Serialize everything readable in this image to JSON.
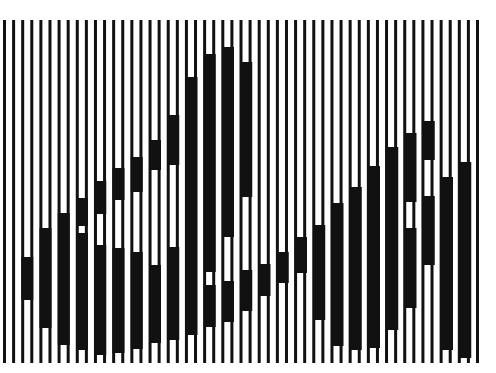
{
  "image": {
    "description": "Black and white optical illusion: vertical line grating with a hidden shape formed by thickened stripe segments",
    "background_color": "#ffffff",
    "ink_color": "#111111",
    "width": 496,
    "height": 373
  },
  "grating": {
    "top": 20,
    "bottom": 363,
    "first_line_x": 3,
    "line_width": 3,
    "line_period": 9,
    "line_count": 53,
    "band_period": 18.25,
    "band_width": 12
  },
  "bands": [
    {
      "k": 0,
      "segments": []
    },
    {
      "k": 1,
      "segments": [
        [
          257,
          300
        ]
      ]
    },
    {
      "k": 2,
      "segments": [
        [
          228,
          328
        ]
      ]
    },
    {
      "k": 3,
      "segments": [
        [
          213,
          345
        ]
      ]
    },
    {
      "k": 4,
      "segments": [
        [
          198,
          226
        ],
        [
          233,
          350
        ]
      ]
    },
    {
      "k": 5,
      "segments": [
        [
          181,
          214
        ],
        [
          245,
          355
        ]
      ]
    },
    {
      "k": 6,
      "segments": [
        [
          168,
          200
        ],
        [
          248,
          353
        ]
      ]
    },
    {
      "k": 7,
      "segments": [
        [
          157,
          192
        ],
        [
          252,
          349
        ]
      ]
    },
    {
      "k": 8,
      "segments": [
        [
          140,
          170
        ],
        [
          265,
          343
        ]
      ]
    },
    {
      "k": 9,
      "segments": [
        [
          115,
          165
        ],
        [
          247,
          340
        ]
      ]
    },
    {
      "k": 10,
      "segments": [
        [
          77,
          335
        ]
      ]
    },
    {
      "k": 11,
      "segments": [
        [
          54,
          272
        ],
        [
          285,
          327
        ]
      ]
    },
    {
      "k": 12,
      "segments": [
        [
          47,
          237
        ],
        [
          281,
          322
        ]
      ]
    },
    {
      "k": 13,
      "segments": [
        [
          62,
          197
        ],
        [
          270,
          311
        ]
      ]
    },
    {
      "k": 14,
      "segments": [
        [
          264,
          296
        ]
      ]
    },
    {
      "k": 15,
      "segments": [
        [
          252,
          283
        ]
      ]
    },
    {
      "k": 16,
      "segments": [
        [
          237,
          273
        ]
      ]
    },
    {
      "k": 17,
      "segments": [
        [
          225,
          320
        ]
      ]
    },
    {
      "k": 18,
      "segments": [
        [
          203,
          346
        ]
      ]
    },
    {
      "k": 19,
      "segments": [
        [
          187,
          350
        ]
      ]
    },
    {
      "k": 20,
      "segments": [
        [
          166,
          348
        ]
      ]
    },
    {
      "k": 21,
      "segments": [
        [
          147,
          330
        ]
      ]
    },
    {
      "k": 22,
      "segments": [
        [
          133,
          202
        ],
        [
          228,
          308
        ]
      ]
    },
    {
      "k": 23,
      "segments": [
        [
          121,
          160
        ],
        [
          196,
          265
        ]
      ]
    },
    {
      "k": 24,
      "segments": [
        [
          177,
          350
        ]
      ]
    },
    {
      "k": 25,
      "segments": [
        [
          162,
          358
        ]
      ]
    }
  ]
}
